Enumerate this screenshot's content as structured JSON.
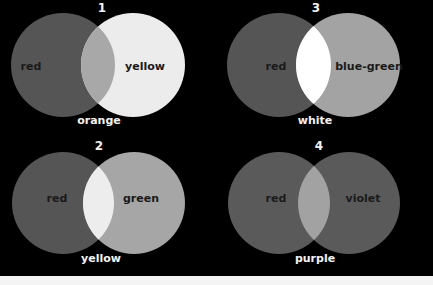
{
  "diagrams": [
    {
      "number": "1",
      "left": {
        "label": "red",
        "color": "#555555"
      },
      "right": {
        "label": "yellow",
        "color": "#ececec"
      },
      "overlap": {
        "label": "orange",
        "color": "#a8a8a8"
      }
    },
    {
      "number": "3",
      "left": {
        "label": "red",
        "color": "#555555"
      },
      "right": {
        "label": "blue-green",
        "color": "#a3a3a3"
      },
      "overlap": {
        "label": "white",
        "color": "#ffffff"
      }
    },
    {
      "number": "2",
      "left": {
        "label": "red",
        "color": "#555555"
      },
      "right": {
        "label": "green",
        "color": "#a6a6a6"
      },
      "overlap": {
        "label": "yellow",
        "color": "#ededed"
      }
    },
    {
      "number": "4",
      "left": {
        "label": "red",
        "color": "#5a5a5a"
      },
      "right": {
        "label": "violet",
        "color": "#5a5a5a"
      },
      "overlap": {
        "label": "purple",
        "color": "#a2a2a2"
      }
    }
  ],
  "colors": {
    "background": "#000000",
    "bottom_strip": "#f4f4f4"
  }
}
